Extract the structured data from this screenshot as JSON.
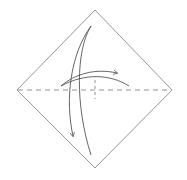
{
  "diagram": {
    "type": "origami-fold-step",
    "colors": {
      "background": "#ffffff",
      "outline": "#8a8a8a",
      "arrow": "#555555",
      "dashed": "#777777"
    },
    "shapes": {
      "diamond": {
        "top": [
          95,
          10
        ],
        "right": [
          172,
          90
        ],
        "bottom": [
          95,
          168
        ],
        "left": [
          17,
          90
        ]
      },
      "valley_fold_line": {
        "x1": 17,
        "y1": 90,
        "x2": 172,
        "y2": 90
      },
      "center_crease_mark": {
        "x1": 95,
        "y1": 80,
        "x2": 95,
        "y2": 99
      }
    },
    "arrows": [
      {
        "name": "fold-down-arrow",
        "direction": "down"
      },
      {
        "name": "fold-right-arrow",
        "direction": "right"
      }
    ]
  }
}
